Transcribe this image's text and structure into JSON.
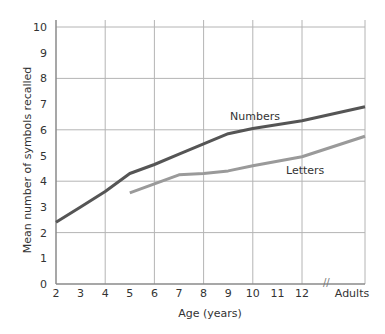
{
  "chart_data": {
    "type": "line",
    "title": "",
    "xlabel": "Age (years)",
    "ylabel": "Mean number of symbols recalled",
    "x_tick_labels": [
      "2",
      "3",
      "4",
      "5",
      "6",
      "7",
      "8",
      "9",
      "10",
      "11",
      "12",
      "Adults"
    ],
    "y_tick_labels": [
      "0",
      "1",
      "2",
      "3",
      "4",
      "5",
      "6",
      "7",
      "8",
      "9",
      "10"
    ],
    "ylim": [
      0,
      10
    ],
    "grid": true,
    "grid_y_values": [
      0,
      2,
      4,
      6,
      8,
      10
    ],
    "grid_x_values": [
      "2",
      "4",
      "6",
      "8",
      "10",
      "12",
      "Adults"
    ],
    "axis_break": "between 12 and Adults",
    "legend_position": "inline labels",
    "series": [
      {
        "name": "Numbers",
        "color": "#555555",
        "points": [
          {
            "x": "2",
            "y": 2.4
          },
          {
            "x": "3",
            "y": 3.0
          },
          {
            "x": "4",
            "y": 3.6
          },
          {
            "x": "5",
            "y": 4.3
          },
          {
            "x": "6",
            "y": 4.65
          },
          {
            "x": "7",
            "y": 5.05
          },
          {
            "x": "8",
            "y": 5.45
          },
          {
            "x": "9",
            "y": 5.85
          },
          {
            "x": "10",
            "y": 6.05
          },
          {
            "x": "12",
            "y": 6.35
          },
          {
            "x": "Adults",
            "y": 6.9
          }
        ]
      },
      {
        "name": "Letters",
        "color": "#9a9a9a",
        "points": [
          {
            "x": "5",
            "y": 3.55
          },
          {
            "x": "6",
            "y": 3.9
          },
          {
            "x": "7",
            "y": 4.25
          },
          {
            "x": "8",
            "y": 4.3
          },
          {
            "x": "9",
            "y": 4.4
          },
          {
            "x": "10",
            "y": 4.6
          },
          {
            "x": "12",
            "y": 4.95
          },
          {
            "x": "Adults",
            "y": 5.75
          }
        ]
      }
    ]
  },
  "labels": {
    "numbers": "Numbers",
    "letters": "Letters",
    "xlabel": "Age (years)",
    "ylabel": "Mean number of symbols recalled",
    "break_mark": "//"
  },
  "colors": {
    "grid": "#b4b4b4",
    "axis": "#8a8a8a",
    "numbers": "#555555",
    "letters": "#9a9a9a"
  }
}
